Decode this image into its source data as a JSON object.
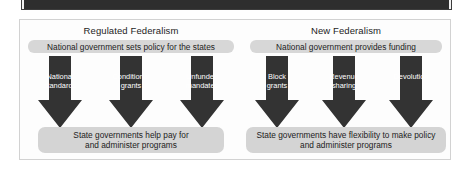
{
  "figure": {
    "panels": [
      {
        "id": "regulated-federalism",
        "title": "Regulated Federalism",
        "top_band": "National government sets policy for the states",
        "arrows": [
          {
            "label": "National\nstandards"
          },
          {
            "label": "Conditional\ngrants"
          },
          {
            "label": "Unfunded\nmandates"
          }
        ],
        "outcome": "State governments help pay for\nand administer programs"
      },
      {
        "id": "new-federalism",
        "title": "New Federalism",
        "top_band": "National government provides funding",
        "arrows": [
          {
            "label": "Block\ngrants"
          },
          {
            "label": "Revenue\nsharing"
          },
          {
            "label": "Devolution"
          }
        ],
        "outcome": "State governments have flexibility to make policy\nand administer programs"
      }
    ]
  },
  "colors": {
    "arrow_fill": "#333333",
    "band_fill": "#d7d7d7",
    "outcome_fill": "#d4d4d4",
    "frame_border": "#d2d2d2",
    "top_band_dark": "#2e2e2e",
    "page_background": "#ffffff",
    "text": "#1c1c1c",
    "arrow_text": "#ffffff"
  }
}
